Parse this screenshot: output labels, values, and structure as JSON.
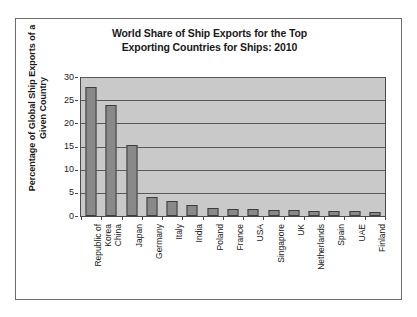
{
  "chart_data": {
    "type": "bar",
    "title": "World Share of Ship Exports for the Top Exporting Countries for Ships: 2010",
    "title_line1": "World Share of Ship Exports for the Top",
    "title_line2": "Exporting Countries for Ships: 2010",
    "xlabel": "",
    "ylabel": "Percentage of Global Ship Exports of a Given Country",
    "ylabel_line1": "Percentage of Global Ship Exports of a",
    "ylabel_line2": "Given Country",
    "categories": [
      "Republic of Korea",
      "China",
      "Japan",
      "Germany",
      "Italy",
      "India",
      "Poland",
      "France",
      "USA",
      "Singapore",
      "UK",
      "Netherlands",
      "Spain",
      "UAE",
      "Finland"
    ],
    "category_lines": [
      [
        "Republic of",
        "Korea"
      ],
      [
        "China"
      ],
      [
        "Japan"
      ],
      [
        "Germany"
      ],
      [
        "Italy"
      ],
      [
        "India"
      ],
      [
        "Poland"
      ],
      [
        "France"
      ],
      [
        "USA"
      ],
      [
        "Singapore"
      ],
      [
        "UK"
      ],
      [
        "Netherlands"
      ],
      [
        "Spain"
      ],
      [
        "UAE"
      ],
      [
        "Finland"
      ]
    ],
    "values": [
      27.9,
      23.9,
      15.4,
      4.1,
      3.2,
      2.4,
      1.8,
      1.6,
      1.5,
      1.2,
      1.2,
      1.1,
      1.1,
      1.1,
      0.9
    ],
    "ylim": [
      0,
      30
    ],
    "yticks": [
      0,
      5,
      10,
      15,
      20,
      25,
      30
    ],
    "ytick_labels": [
      "0",
      "5",
      "10",
      "15",
      "20",
      "25",
      "30"
    ],
    "grid": true,
    "grid_axis": "y",
    "legend": false,
    "colors": {
      "bar_fill": "#898989",
      "bar_border": "#3d3d3d",
      "plot_background": "#c9c9c9",
      "gridline": "#5a5a5a",
      "axis": "#4a4a4a",
      "figure_background": "#ffffff",
      "figure_border": "#6b6b6b",
      "text": "#1a1a1a"
    }
  }
}
